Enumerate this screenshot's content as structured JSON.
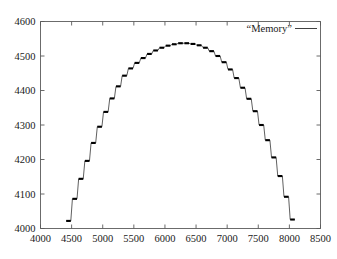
{
  "chart_data": {
    "type": "line",
    "title": "",
    "subtitle": "",
    "xlabel": "",
    "ylabel": "",
    "xlim": [
      4000,
      8500
    ],
    "ylim": [
      4000,
      4600
    ],
    "grid": false,
    "legend_position": "top-right",
    "legend": [
      "“Memory”"
    ],
    "xticks": [
      4000,
      4500,
      5000,
      5500,
      6000,
      6500,
      7000,
      7500,
      8000,
      8500
    ],
    "xtick_labels": [
      "4000",
      "4500",
      "5000",
      "5500",
      "6000",
      "6500",
      "7000",
      "7500",
      "8000",
      "8500"
    ],
    "yticks": [
      4000,
      4100,
      4200,
      4300,
      4400,
      4500,
      4600
    ],
    "ytick_labels": [
      "4000",
      "4100",
      "4200",
      "4300",
      "4400",
      "4500",
      "4600"
    ],
    "line_color": "#2b2b2b",
    "marker_style": "horizontal-plateau",
    "series": [
      {
        "name": "“Memory”",
        "x": [
          4450,
          4550,
          4650,
          4750,
          4850,
          4950,
          5050,
          5150,
          5250,
          5350,
          5450,
          5550,
          5650,
          5750,
          5850,
          5950,
          6050,
          6150,
          6250,
          6350,
          6450,
          6550,
          6650,
          6750,
          6850,
          6950,
          7050,
          7150,
          7250,
          7350,
          7450,
          7550,
          7650,
          7750,
          7850,
          7950,
          8050
        ],
        "y": [
          4022,
          4086,
          4144,
          4196,
          4248,
          4295,
          4338,
          4377,
          4412,
          4443,
          4464,
          4480,
          4494,
          4506,
          4516,
          4524,
          4530,
          4534,
          4537,
          4537,
          4535,
          4531,
          4524,
          4514,
          4500,
          4482,
          4461,
          4436,
          4408,
          4376,
          4340,
          4300,
          4256,
          4206,
          4152,
          4092,
          4026
        ]
      }
    ]
  },
  "legend": {
    "entry_label": "“Memory”"
  },
  "axes": {
    "x_tick_labels": [
      "4000",
      "4500",
      "5000",
      "5500",
      "6000",
      "6500",
      "7000",
      "7500",
      "8000",
      "8500"
    ],
    "y_tick_labels": [
      "4600",
      "4500",
      "4400",
      "4300",
      "4200",
      "4100",
      "4000"
    ]
  },
  "colors": {
    "line": "#2b2b2b",
    "frame": "#5a5a5a",
    "text": "#1a1a1a",
    "background": "#ffffff"
  }
}
